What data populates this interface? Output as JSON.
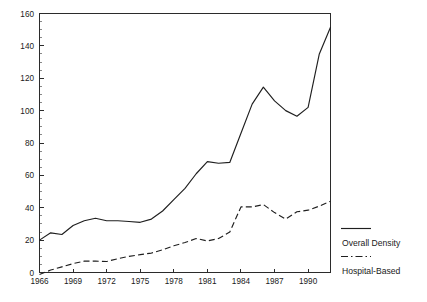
{
  "chart_data": {
    "type": "line",
    "title": "",
    "subtitle": "",
    "xlabel": "",
    "ylabel": "",
    "xlim": [
      1966,
      1992
    ],
    "ylim": [
      0,
      160
    ],
    "grid": false,
    "legend_position": "right",
    "y_ticks": [
      0,
      20,
      40,
      60,
      80,
      100,
      120,
      140,
      160
    ],
    "y_tick_labels": [
      "0",
      "20",
      "40",
      "60",
      "80",
      "100",
      "120",
      "140",
      "160"
    ],
    "y_minor_tick_step": 5,
    "x_ticks": [
      1966,
      1969,
      1972,
      1975,
      1978,
      1981,
      1984,
      1987,
      1990
    ],
    "x_tick_labels": [
      "1966",
      "1969",
      "1972",
      "1975",
      "1978",
      "1981",
      "1984",
      "1987",
      "1990"
    ],
    "x": [
      1966,
      1967,
      1968,
      1969,
      1970,
      1971,
      1972,
      1973,
      1974,
      1975,
      1976,
      1977,
      1978,
      1979,
      1980,
      1981,
      1982,
      1983,
      1984,
      1985,
      1986,
      1987,
      1988,
      1989,
      1990,
      1991,
      1992
    ],
    "series": [
      {
        "name": "Overall Density",
        "style": "solid",
        "color": "#1f1f1f",
        "values": [
          20,
          24.5,
          23.5,
          29,
          32,
          33.5,
          32,
          32,
          31.5,
          31,
          33,
          38,
          45,
          52,
          61,
          68.5,
          67.5,
          68,
          86,
          104,
          114.5,
          106,
          100,
          96.5,
          102,
          135,
          151.5
        ]
      },
      {
        "name": "Hospital-Based",
        "style": "dashed",
        "color": "#1f1f1f",
        "values": [
          -1.2,
          1.5,
          3.5,
          5.5,
          7,
          7,
          6.8,
          8.5,
          10,
          11,
          12,
          14,
          16.5,
          18.5,
          21,
          19.5,
          21,
          25,
          40.5,
          40.5,
          42,
          37,
          33,
          37.5,
          38.5,
          41,
          44
        ]
      }
    ]
  },
  "legend": {
    "entries": [
      {
        "label": "Overall Density",
        "style": "solid"
      },
      {
        "label": "Hospital-Based",
        "style": "dashed"
      }
    ]
  }
}
